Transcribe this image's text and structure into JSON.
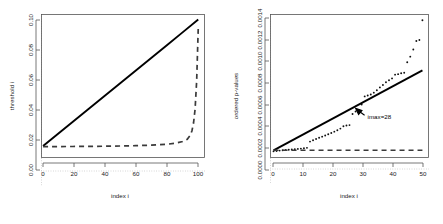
{
  "figure": {
    "background": "#ffffff",
    "panel_count": 2
  },
  "chart_data": [
    {
      "type": "line",
      "panel": "left",
      "title": "",
      "xlabel": "index i",
      "ylabel": "threshold i",
      "xlim": [
        0,
        104
      ],
      "ylim": [
        -0.008,
        0.104
      ],
      "xticks": [
        0,
        20,
        40,
        60,
        80,
        100
      ],
      "xticklabels": [
        "0",
        "20",
        "40",
        "60",
        "80",
        "100"
      ],
      "yticks": [
        0.0,
        0.02,
        0.04,
        0.06,
        0.08,
        0.1
      ],
      "yticklabels": [
        "0.00",
        "0.02",
        "0.04",
        "0.06",
        "0.08",
        "0.10"
      ],
      "grid": "dotted-reference-lines",
      "legend": "none",
      "series": [
        {
          "name": "Benjamini-Hochberg linear threshold",
          "style": "solid",
          "color": "#000000",
          "x": [
            1,
            10,
            20,
            30,
            40,
            50,
            60,
            70,
            80,
            90,
            100
          ],
          "y": [
            0.001,
            0.01,
            0.02,
            0.03,
            0.04,
            0.05,
            0.06,
            0.07,
            0.08,
            0.09,
            0.1
          ]
        },
        {
          "name": "Hochberg / Bonferroni-type threshold",
          "style": "dashed",
          "color": "#3a3a3a",
          "x": [
            1,
            5,
            10,
            20,
            30,
            40,
            50,
            60,
            70,
            80,
            85,
            90,
            93,
            95,
            96,
            97,
            98,
            99,
            100
          ],
          "y": [
            0.0005,
            0.00053,
            0.00056,
            0.00063,
            0.00071,
            0.00083,
            0.001,
            0.00125,
            0.00167,
            0.0024,
            0.0031,
            0.0045,
            0.0063,
            0.0095,
            0.013,
            0.019,
            0.03,
            0.052,
            0.093
          ]
        }
      ],
      "reference_lines": [
        {
          "orientation": "horizontal",
          "value": 0.0,
          "style": "dotted",
          "color": "#b8b8b8"
        },
        {
          "orientation": "vertical",
          "value": 0.0,
          "style": "dotted",
          "color": "#b8b8b8"
        }
      ]
    },
    {
      "type": "scatter",
      "panel": "right",
      "title": "",
      "xlabel": "index i",
      "ylabel": "ordered p-values",
      "xlim": [
        0,
        52
      ],
      "ylim": [
        -6e-05,
        0.00145
      ],
      "xticks": [
        0,
        10,
        20,
        30,
        40,
        50
      ],
      "xticklabels": [
        "0",
        "10",
        "20",
        "30",
        "40",
        "50"
      ],
      "yticks": [
        0.0,
        0.0002,
        0.0004,
        0.0006,
        0.0008,
        0.001,
        0.0012,
        0.0014
      ],
      "yticklabels": [
        "0.0000",
        "0.0002",
        "0.0004",
        "0.0006",
        "0.0008",
        "0.0010",
        "0.0012",
        "0.0014"
      ],
      "grid": "dotted-reference-lines",
      "legend": "none",
      "series": [
        {
          "name": "ordered p-values",
          "style": "points",
          "color": "#111111",
          "x": [
            1,
            2,
            3,
            4,
            5,
            6,
            7,
            8,
            9,
            10,
            11,
            12,
            13,
            14,
            15,
            16,
            17,
            18,
            19,
            20,
            21,
            22,
            23,
            24,
            25,
            26,
            27,
            28,
            29,
            30,
            31,
            32,
            33,
            34,
            35,
            36,
            37,
            38,
            39,
            40,
            41,
            42,
            43,
            44,
            45,
            46,
            47,
            48,
            49,
            50
          ],
          "y": [
            5e-06,
            9e-06,
            1.3e-05,
            1.6e-05,
            1.9e-05,
            2.2e-05,
            2.5e-05,
            2.8e-05,
            3.1e-05,
            3.4e-05,
            3.8e-05,
            4.2e-05,
            0.000108,
            0.000122,
            0.000135,
            0.000148,
            0.00016,
            0.000172,
            0.000185,
            0.000198,
            0.000213,
            0.000228,
            0.000245,
            0.00027,
            0.000278,
            0.000282,
            0.0004,
            0.000425,
            0.00044,
            0.0005,
            0.000585,
            0.000595,
            0.000605,
            0.000625,
            0.00065,
            0.00068,
            0.000705,
            0.000735,
            0.000755,
            0.000775,
            0.000815,
            0.00082,
            0.00083,
            0.000835,
            0.000945,
            0.001005,
            0.00108,
            0.00117,
            0.00118,
            0.00139
          ]
        },
        {
          "name": "Benjamini-Hochberg linear threshold",
          "style": "solid",
          "color": "#000000",
          "x": [
            1,
            50
          ],
          "y": [
            1.6e-05,
            0.00086
          ]
        },
        {
          "name": "Bonferroni threshold",
          "style": "dashed",
          "color": "#3a3a3a",
          "x": [
            1,
            50
          ],
          "y": [
            1.7e-05,
            1.7e-05
          ]
        }
      ],
      "reference_lines": [
        {
          "orientation": "horizontal",
          "value": 0.0,
          "style": "dotted",
          "color": "#b8b8b8"
        },
        {
          "orientation": "vertical",
          "value": 0.0,
          "style": "dotted",
          "color": "#b8b8b8"
        }
      ],
      "annotations": [
        {
          "name": "imax-annotation",
          "label": "imax=28",
          "points_to_x": 28,
          "points_to_y": 0.00046,
          "arrow": true
        }
      ]
    }
  ]
}
